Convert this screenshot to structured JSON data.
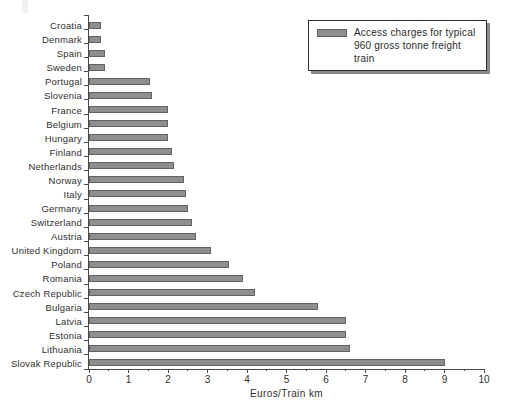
{
  "legend": {
    "line1": "Access charges for typical",
    "line2": "960 gross tonne freight train"
  },
  "chart_data": {
    "type": "bar",
    "orientation": "horizontal",
    "title": "",
    "xlabel": "Euros/Train km",
    "ylabel": "",
    "xlim": [
      0,
      10
    ],
    "x_major_ticks": [
      0,
      1,
      2,
      3,
      4,
      5,
      6,
      7,
      8,
      9,
      10
    ],
    "x_minor_tick_step": 0.5,
    "grid": false,
    "legend_position": "upper right",
    "legend_label": "Access charges for typical 960 gross tonne freight train",
    "bar_color": "#8e8e8e",
    "bar_border_color": "#636363",
    "categories": [
      "Croatia",
      "Denmark",
      "Spain",
      "Sweden",
      "Portugal",
      "Slovenia",
      "France",
      "Belgium",
      "Hungary",
      "Finland",
      "Netherlands",
      "Norway",
      "Italy",
      "Germany",
      "Switzerland",
      "Austria",
      "United Kingdom",
      "Poland",
      "Romania",
      "Czech Republic",
      "Bulgaria",
      "Latvia",
      "Estonia",
      "Lithuania",
      "Slovak Republic"
    ],
    "values": [
      0.3,
      0.3,
      0.4,
      0.4,
      1.55,
      1.6,
      2.0,
      2.0,
      2.0,
      2.1,
      2.15,
      2.4,
      2.45,
      2.5,
      2.6,
      2.7,
      3.1,
      3.55,
      3.9,
      4.2,
      5.8,
      6.5,
      6.5,
      6.6,
      9.0
    ]
  }
}
